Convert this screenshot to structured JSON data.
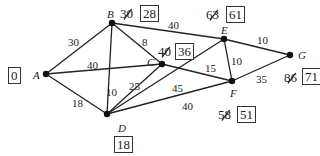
{
  "nodes": [
    {
      "id": "A",
      "x": 46,
      "y": 74,
      "label": "A",
      "final": "0",
      "old": ""
    },
    {
      "id": "B",
      "x": 112,
      "y": 23,
      "label": "B",
      "final": "28",
      "old": "30"
    },
    {
      "id": "C",
      "x": 162,
      "y": 64,
      "label": "C",
      "final": "36",
      "old": "40"
    },
    {
      "id": "D",
      "x": 107,
      "y": 114,
      "label": "D",
      "final": "18",
      "old": ""
    },
    {
      "id": "E",
      "x": 224,
      "y": 39,
      "label": "E",
      "final": "61",
      "old": "63"
    },
    {
      "id": "F",
      "x": 232,
      "y": 81,
      "label": "F",
      "final": "51",
      "old": "58"
    },
    {
      "id": "G",
      "x": 290,
      "y": 55,
      "label": "G",
      "final": "71",
      "old": "86"
    }
  ],
  "edges": [
    {
      "from": "A",
      "to": "B",
      "weight": "30"
    },
    {
      "from": "A",
      "to": "C",
      "weight": "40"
    },
    {
      "from": "A",
      "to": "D",
      "weight": "18"
    },
    {
      "from": "B",
      "to": "C",
      "weight": "8"
    },
    {
      "from": "B",
      "to": "E",
      "weight": "40"
    },
    {
      "from": "B",
      "to": "D",
      "weight": "10"
    },
    {
      "from": "C",
      "to": "D",
      "weight": "25"
    },
    {
      "from": "C",
      "to": "F",
      "weight": "15"
    },
    {
      "from": "D",
      "to": "E",
      "weight": "45"
    },
    {
      "from": "D",
      "to": "F",
      "weight": "40"
    },
    {
      "from": "E",
      "to": "F",
      "weight": "10"
    },
    {
      "from": "E",
      "to": "G",
      "weight": "10"
    },
    {
      "from": "F",
      "to": "G",
      "weight": "35"
    }
  ]
}
